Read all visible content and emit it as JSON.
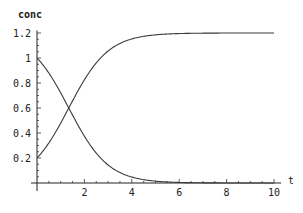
{
  "chart_data": {
    "type": "line",
    "title": "",
    "xlabel": "t",
    "ylabel": "conc",
    "xlim": [
      0,
      10.3
    ],
    "ylim": [
      0,
      1.2
    ],
    "grid": false,
    "legend": null,
    "x_ticks": [
      2,
      4,
      6,
      8,
      10
    ],
    "x_tick_labels": [
      "2",
      "4",
      "6",
      "8",
      "10"
    ],
    "y_ticks": [
      0.2,
      0.4,
      0.6,
      0.8,
      1.0,
      1.2
    ],
    "y_tick_labels": [
      "0.2",
      "0.4",
      "0.6",
      "0.8",
      "1",
      "1.2"
    ],
    "x": [
      0,
      0.5,
      1,
      1.5,
      2,
      2.5,
      3,
      3.5,
      4,
      4.5,
      5,
      6,
      7,
      8,
      9,
      10
    ],
    "series": [
      {
        "name": "decreasing concentration",
        "values": [
          1.0,
          0.8795,
          0.7211,
          0.543,
          0.374,
          0.239,
          0.1442,
          0.0837,
          0.0474,
          0.0265,
          0.0147,
          0.0045,
          0.0013,
          0.0004,
          0.0001,
          0.0
        ]
      },
      {
        "name": "increasing concentration",
        "values": [
          0.2,
          0.3205,
          0.4789,
          0.657,
          0.826,
          0.961,
          1.0558,
          1.1163,
          1.1526,
          1.1735,
          1.1853,
          1.1955,
          1.1987,
          1.1996,
          1.1999,
          1.2
        ]
      }
    ],
    "annotations": [
      "curves cross at approximately t=1.35, conc=0.6"
    ]
  },
  "labels": {
    "ylabel": "conc",
    "xlabel": "t"
  }
}
